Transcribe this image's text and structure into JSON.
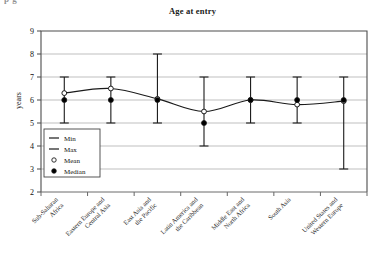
{
  "page": {
    "top_cut_text": "p   g"
  },
  "chart_data": {
    "type": "line",
    "title": "Age at entry",
    "xlabel": "",
    "ylabel": "years",
    "ylim": [
      2,
      9
    ],
    "yticks": [
      9,
      8,
      7,
      6,
      5,
      4,
      3,
      2
    ],
    "grid": true,
    "legend_position": "inside-left",
    "categories": [
      "Sub-Saharan Africa",
      "Eastern Europe and Central Asia",
      "East Asia and the Pacific",
      "Latin America and the Caribbean",
      "Middle East and North Africa",
      "South Asia",
      "United States and Western Europe"
    ],
    "category_lines": [
      [
        "Sub-Saharan",
        "Africa"
      ],
      [
        "Eastern Europe and",
        "Central Asia"
      ],
      [
        "East Asia and",
        "the Pacific"
      ],
      [
        "Latin America and",
        "the Caribbean"
      ],
      [
        "Middle East and",
        "North Africa"
      ],
      [
        "South Asia"
      ],
      [
        "United States and",
        "Western Europe"
      ]
    ],
    "series": [
      {
        "name": "Min",
        "values": [
          5,
          5,
          5,
          4,
          5,
          5,
          3
        ]
      },
      {
        "name": "Max",
        "values": [
          7,
          7,
          8,
          7,
          7,
          7,
          7
        ]
      },
      {
        "name": "Mean",
        "values": [
          6.3,
          6.5,
          6.05,
          5.5,
          6.0,
          5.8,
          5.95
        ]
      },
      {
        "name": "Median",
        "values": [
          6,
          6,
          6,
          5,
          6,
          6,
          6
        ]
      }
    ],
    "legend": [
      {
        "label": "Min",
        "marker": "line"
      },
      {
        "label": "Max",
        "marker": "line"
      },
      {
        "label": "Mean",
        "marker": "open-circle"
      },
      {
        "label": "Median",
        "marker": "filled-circle"
      }
    ],
    "colors": {
      "line": "#1a1a1a",
      "grid": "#b8b8b8",
      "frame": "#4d4d4d",
      "marker_fill": "#000000",
      "marker_open_fill": "#ffffff",
      "background": "#ffffff"
    }
  }
}
